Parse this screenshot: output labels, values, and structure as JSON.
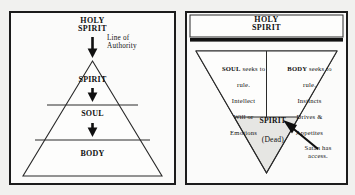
{
  "diagram": {
    "title_left": "Holy Spirit authority over Spirit, Soul, Body",
    "title_right": "Inverted order with dead spirit"
  },
  "left_panel": {
    "header": "HOLY\nSPIRIT",
    "annotation": "Line of\nAuthority",
    "tiers": [
      {
        "label": "SPIRIT"
      },
      {
        "label": "SOUL"
      },
      {
        "label": "BODY"
      }
    ],
    "arrows": [
      {
        "name": "holy-spirit-to-apex"
      },
      {
        "name": "spirit-to-soul"
      },
      {
        "name": "soul-to-body"
      }
    ]
  },
  "right_panel": {
    "header": "HOLY\nSPIRIT",
    "barrier": "solid-black-bar",
    "soul_block": {
      "heading": "SOUL",
      "heading_rest": " seeks to",
      "line2": "rule.",
      "line3": "Intellect",
      "line4": "Will or",
      "line5": "Emotions"
    },
    "body_block": {
      "heading": "BODY",
      "heading_rest": " seeks to",
      "line2": "rule.",
      "line3": "Instincts",
      "line4": "Drives &",
      "line5": "Appetites"
    },
    "spirit_block": {
      "name": "SPIRIT",
      "state": "(Dead)"
    },
    "satan_note": "Satan has\naccess."
  },
  "colors": {
    "ink": "#1b1b1b",
    "paper": "#fbfbfa",
    "page": "#f1f1ef",
    "shade": "#e3e3e0",
    "hairline": "#4a4a4a"
  }
}
